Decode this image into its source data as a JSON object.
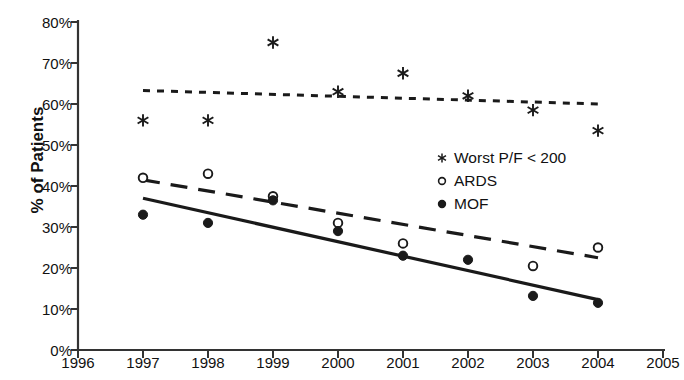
{
  "chart_data": {
    "type": "scatter",
    "title": "",
    "xlabel": "",
    "ylabel": "% of Patients",
    "xlim": [
      1996,
      2005
    ],
    "ylim": [
      0,
      0.8
    ],
    "grid": false,
    "legend_position": "center-right",
    "x_ticks": [
      "1996",
      "1997",
      "1998",
      "1999",
      "2000",
      "2001",
      "2002",
      "2003",
      "2004",
      "2005"
    ],
    "x_tick_values": [
      1996,
      1997,
      1998,
      1999,
      2000,
      2001,
      2002,
      2003,
      2004,
      2005
    ],
    "y_ticks": [
      "0%",
      "10%",
      "20%",
      "30%",
      "40%",
      "50%",
      "60%",
      "70%",
      "80%"
    ],
    "y_tick_values": [
      0,
      10,
      20,
      30,
      40,
      50,
      60,
      70,
      80
    ],
    "series": [
      {
        "name": "Worst P/F < 200",
        "marker": "asterisk",
        "trendline": "dotted",
        "color": "#1a1a1a",
        "x": [
          1997,
          1998,
          1999,
          2000,
          2001,
          2002,
          2003,
          2004
        ],
        "values": [
          56.0,
          56.0,
          75.0,
          63.0,
          67.5,
          62.0,
          58.5,
          53.5
        ],
        "trend_start": [
          1997,
          63.3
        ],
        "trend_end": [
          2004,
          60.0
        ]
      },
      {
        "name": "ARDS",
        "marker": "open-circle",
        "trendline": "dashed",
        "color": "#1a1a1a",
        "x": [
          1997,
          1998,
          1999,
          2000,
          2001,
          2003,
          2004
        ],
        "values": [
          42.0,
          43.0,
          37.5,
          31.0,
          26.0,
          20.5,
          25.0
        ],
        "trend_start": [
          1997,
          41.5
        ],
        "trend_end": [
          2004,
          22.5
        ]
      },
      {
        "name": "MOF",
        "marker": "filled-circle",
        "trendline": "solid",
        "color": "#1a1a1a",
        "x": [
          1997,
          1998,
          1999,
          2000,
          2001,
          2002,
          2003,
          2004
        ],
        "values": [
          33.0,
          31.0,
          36.5,
          29.0,
          23.0,
          22.0,
          13.2,
          11.5
        ],
        "trend_start": [
          1997,
          37.0
        ],
        "trend_end": [
          2004,
          12.3
        ]
      }
    ]
  },
  "legend": {
    "items": [
      {
        "label": "Worst P/F < 200",
        "marker": "asterisk-icon"
      },
      {
        "label": "ARDS",
        "marker": "open-circle-icon"
      },
      {
        "label": "MOF",
        "marker": "filled-circle-icon"
      }
    ]
  },
  "axes": {
    "y_title": "% of Patients"
  }
}
